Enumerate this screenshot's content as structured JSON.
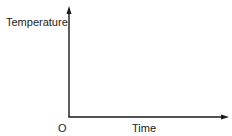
{
  "diagram": {
    "type": "axes-sketch",
    "y_axis": {
      "label": "Temperature"
    },
    "x_axis": {
      "label": "Time"
    },
    "origin_label": "O",
    "colors": {
      "axis": "#1a1a1a",
      "text": "#222222",
      "background": "#ffffff"
    }
  }
}
